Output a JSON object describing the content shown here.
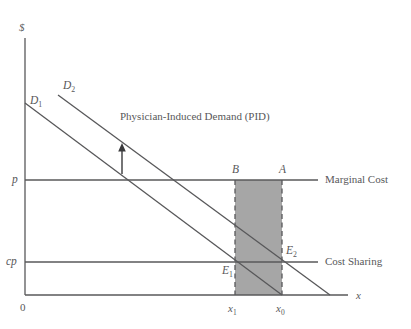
{
  "figure": {
    "title_text": "Physician-Induced Demand (PID)",
    "axes": {
      "y_axis_label": "$",
      "x_axis_label": "x",
      "origin_label": "0"
    },
    "price_ticks": [
      {
        "id": "p",
        "label": "p",
        "y_value": 180
      },
      {
        "id": "cp",
        "label": "cp",
        "y_value": 262
      }
    ],
    "quantity_ticks": [
      {
        "id": "x1",
        "label": "x",
        "sub": "1",
        "x_value": 235
      },
      {
        "id": "x0",
        "label": "x",
        "sub": "0",
        "x_value": 282
      }
    ],
    "curves": [
      {
        "id": "D1",
        "label": "D",
        "sub": "1",
        "x1": 25,
        "y1": 103,
        "x2": 282,
        "y2": 295
      },
      {
        "id": "D2",
        "label": "D",
        "sub": "2",
        "x1": 58,
        "y1": 95,
        "x2": 330,
        "y2": 295
      }
    ],
    "horizontal_lines": [
      {
        "id": "marginal-cost",
        "label": "Marginal Cost",
        "y": 180
      },
      {
        "id": "cost-sharing",
        "label": "Cost Sharing",
        "y": 262
      }
    ],
    "points": [
      {
        "id": "A",
        "label": "A",
        "sub": "",
        "x": 282,
        "y": 180
      },
      {
        "id": "B",
        "label": "B",
        "sub": "",
        "x": 235,
        "y": 180
      },
      {
        "id": "E1",
        "label": "E",
        "sub": "1",
        "x": 235,
        "y": 262
      },
      {
        "id": "E2",
        "label": "E",
        "sub": "2",
        "x": 282,
        "y": 262
      }
    ],
    "shift_arrow": {
      "id": "pid-shift-arrow",
      "x": 122,
      "y_tail": 174,
      "y_head": 145
    },
    "shaded_region": {
      "x_left": 235,
      "x_right": 282,
      "y_top": 180,
      "y_bottom": 295
    },
    "colors": {
      "line": "#58585a",
      "text": "#58585a",
      "shade_fill": "#a6a6a6",
      "background": "#ffffff"
    }
  }
}
